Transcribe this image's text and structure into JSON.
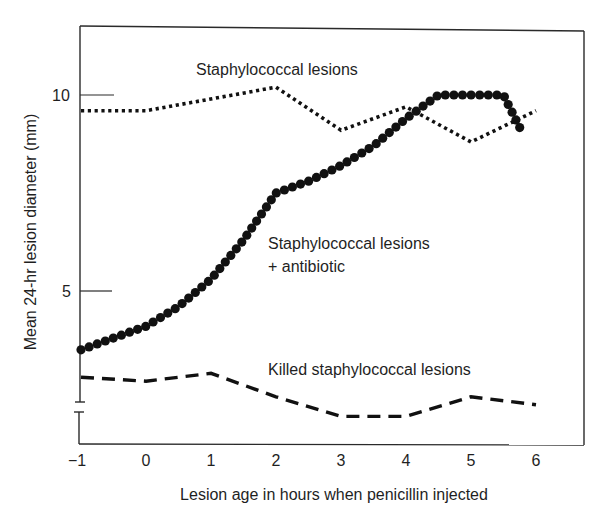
{
  "chart_data": {
    "type": "line",
    "title": "",
    "xlabel": "Lesion age in hours when penicillin injected",
    "ylabel": "Mean 24-hr lesion diameter (mm)",
    "xlim": [
      -1,
      6
    ],
    "ylim": [
      1.5,
      11.7
    ],
    "x_ticks": [
      -1,
      0,
      1,
      2,
      3,
      4,
      5,
      6
    ],
    "x_tick_labels": [
      "−1",
      "0",
      "1",
      "2",
      "3",
      "4",
      "5",
      "6"
    ],
    "y_ticks": [
      5,
      10
    ],
    "y_tick_labels": [
      "5",
      "10"
    ],
    "y_axis_break": true,
    "grid": false,
    "legend": "inline annotations",
    "series": [
      {
        "name": "Staphylococcal lesions",
        "style": "dotted",
        "x": [
          -1,
          0,
          2,
          3,
          4,
          5,
          6
        ],
        "values": [
          9.6,
          9.6,
          10.2,
          9.1,
          9.7,
          8.8,
          9.6
        ]
      },
      {
        "name": "Staphylococcal lesions + antibiotic",
        "style": "large-dots",
        "x": [
          -1,
          -0.5,
          0,
          0.5,
          1,
          1.5,
          2,
          2.5,
          3,
          3.5,
          4,
          4.5,
          5,
          5.5,
          5.8
        ],
        "values": [
          3.5,
          3.8,
          4.1,
          4.6,
          5.3,
          6.3,
          7.5,
          7.8,
          8.2,
          8.7,
          9.4,
          10.0,
          10.0,
          10.0,
          9.0
        ]
      },
      {
        "name": "Killed staphylococcal lesions",
        "style": "dashed",
        "x": [
          -1,
          0,
          1,
          2,
          3,
          4,
          5,
          6
        ],
        "values": [
          2.8,
          2.7,
          2.9,
          2.3,
          1.8,
          1.8,
          2.3,
          2.1
        ]
      }
    ],
    "annotations": [
      {
        "text": "Staphylococcal lesions",
        "x": 1.2,
        "y": 10.6
      },
      {
        "text": "Staphylococcal lesions",
        "x": 1.9,
        "y": 6.3
      },
      {
        "text": "+ antibiotic",
        "x": 1.9,
        "y": 5.8
      },
      {
        "text": "Killed staphylococcal lesions",
        "x": 1.9,
        "y": 3.2
      }
    ]
  },
  "labels": {
    "xlabel": "Lesion age in hours when penicillin injected",
    "ylabel": "Mean 24-hr lesion diameter (mm)",
    "annot_staph": "Staphylococcal lesions",
    "annot_abx_line1": "Staphylococcal lesions",
    "annot_abx_line2": "+ antibiotic",
    "annot_killed": "Killed staphylococcal lesions",
    "tick_x": [
      "−1",
      "0",
      "1",
      "2",
      "3",
      "4",
      "5",
      "6"
    ],
    "tick_y_5": "5",
    "tick_y_10": "10"
  }
}
